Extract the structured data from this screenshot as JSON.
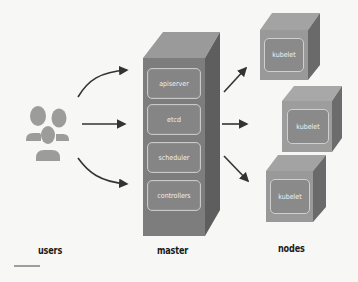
{
  "diagram": {
    "title": "",
    "columns": [
      {
        "id": "users",
        "label": "users"
      },
      {
        "id": "master",
        "label": "master"
      },
      {
        "id": "nodes",
        "label": "nodes"
      }
    ],
    "master": {
      "components": [
        "apiserver",
        "etcd",
        "scheduler",
        "controllers"
      ]
    },
    "nodes": [
      {
        "label": "kubelet"
      },
      {
        "label": "kubelet"
      },
      {
        "label": "kubelet"
      }
    ],
    "edges": [
      {
        "from": "users",
        "to": "master",
        "style": "curved-up"
      },
      {
        "from": "users",
        "to": "master",
        "style": "straight"
      },
      {
        "from": "users",
        "to": "master",
        "style": "curved-down"
      },
      {
        "from": "master",
        "to": "node-1"
      },
      {
        "from": "master",
        "to": "node-2"
      },
      {
        "from": "master",
        "to": "node-3"
      }
    ],
    "colors": {
      "background": "#f7f7f5",
      "box_front": "#7f7f7f",
      "box_top": "#9a9a9a",
      "box_side": "#606060",
      "arrow": "#333333",
      "users_icon": "#9a9a9a"
    }
  }
}
